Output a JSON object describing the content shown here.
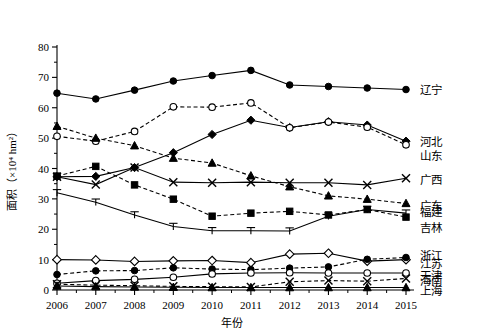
{
  "chart_data": {
    "type": "line",
    "title": "",
    "xlabel": "年份",
    "ylabel": "面积（×10⁴ hm²）",
    "xlim": [
      2006,
      2015
    ],
    "ylim": [
      0,
      80
    ],
    "yticks": [
      0,
      10,
      20,
      30,
      40,
      50,
      60,
      70,
      80
    ],
    "grid": false,
    "legend_position": "right",
    "categories": [
      "2006",
      "2007",
      "2008",
      "2009",
      "2010",
      "2011",
      "2012",
      "2013",
      "2014",
      "2015"
    ],
    "series": [
      {
        "name": "辽宁",
        "marker": "filled-circle",
        "line": "solid",
        "values": [
          64.8,
          62.9,
          65.8,
          68.8,
          70.6,
          72.3,
          67.5,
          67.0,
          66.5,
          66.0
        ]
      },
      {
        "name": "河北",
        "marker": "filled-diamond",
        "line": "solid",
        "values": [
          37.3,
          37.4,
          40.3,
          45.2,
          51.2,
          55.9,
          53.5,
          55.4,
          54.3,
          49.0
        ]
      },
      {
        "name": "山东",
        "marker": "open-circle",
        "line": "dashed",
        "values": [
          50.6,
          49.0,
          52.2,
          60.3,
          60.2,
          61.6,
          53.4,
          55.3,
          53.6,
          47.8
        ]
      },
      {
        "name": "广西",
        "marker": "cross-x",
        "line": "solid",
        "values": [
          37.3,
          34.7,
          40.3,
          35.5,
          35.3,
          35.5,
          35.3,
          35.3,
          34.6,
          36.8
        ]
      },
      {
        "name": "广东",
        "marker": "filled-triangle",
        "line": "dashed",
        "values": [
          53.9,
          50.0,
          47.5,
          43.4,
          41.8,
          37.6,
          34.0,
          31.0,
          29.9,
          28.5
        ]
      },
      {
        "name": "福建",
        "marker": "tri-down-open",
        "line": "solid",
        "values": [
          32.0,
          28.9,
          24.7,
          20.9,
          19.5,
          19.5,
          19.4,
          24.3,
          26.5,
          25.3
        ]
      },
      {
        "name": "吉林",
        "marker": "filled-square",
        "line": "dashed",
        "values": [
          37.5,
          40.7,
          34.6,
          29.9,
          24.3,
          25.3,
          25.9,
          24.7,
          26.5,
          24.0
        ]
      },
      {
        "name": "浙江",
        "marker": "open-diamond",
        "line": "solid",
        "values": [
          10.0,
          9.9,
          9.4,
          9.6,
          9.7,
          9.0,
          11.8,
          12.1,
          9.5,
          10.0
        ]
      },
      {
        "name": "江苏",
        "marker": "filled-circle",
        "line": "dashed",
        "values": [
          5.1,
          6.3,
          6.4,
          7.3,
          6.9,
          6.7,
          7.2,
          7.6,
          10.1,
          10.7
        ]
      },
      {
        "name": "天津",
        "marker": "open-circle",
        "line": "solid",
        "values": [
          2.2,
          3.1,
          3.5,
          4.2,
          5.3,
          5.6,
          5.7,
          5.6,
          5.6,
          5.6
        ]
      },
      {
        "name": "海南",
        "marker": "cross-x",
        "line": "dashed",
        "values": [
          1.9,
          1.6,
          1.4,
          1.2,
          1.1,
          1.0,
          2.7,
          3.1,
          2.9,
          3.8
        ]
      },
      {
        "name": "上海",
        "marker": "filled-triangle",
        "line": "solid",
        "values": [
          1.3,
          1.1,
          1.0,
          0.9,
          0.8,
          0.8,
          0.8,
          0.8,
          0.8,
          0.8
        ]
      }
    ],
    "legend_entries": [
      "辽宁",
      "河北",
      "山东",
      "广西",
      "广东",
      "福建",
      "吉林",
      "浙江",
      "江苏",
      "天津",
      "海南",
      "上海"
    ]
  }
}
